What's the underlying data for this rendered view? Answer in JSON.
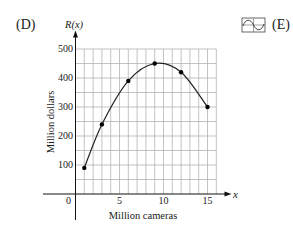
{
  "figure": {
    "panel_label": "(D)",
    "option_label": "(E)",
    "icon": "graphing-calculator-icon"
  },
  "chart_data": {
    "type": "line",
    "title": "",
    "function_label": "R(x)",
    "x_axis_var": "x",
    "xlabel": "Million cameras",
    "ylabel": "Million dollars",
    "x": [
      1,
      3,
      6,
      9,
      12,
      15
    ],
    "series": [
      {
        "name": "R(x)",
        "values": [
          90,
          240,
          390,
          450,
          420,
          300
        ]
      }
    ],
    "xlim": [
      0,
      16
    ],
    "ylim": [
      0,
      500
    ],
    "xticks": [
      0,
      5,
      10,
      15
    ],
    "xtick_labels": [
      "0",
      "5",
      "10",
      "15"
    ],
    "yticks": [
      100,
      200,
      300,
      400,
      500
    ],
    "ytick_labels": [
      "100",
      "200",
      "300",
      "400",
      "500"
    ],
    "grid": true,
    "grid_x_step": 1,
    "grid_y_step": 50,
    "markers": true,
    "smooth": true,
    "legend": null
  }
}
